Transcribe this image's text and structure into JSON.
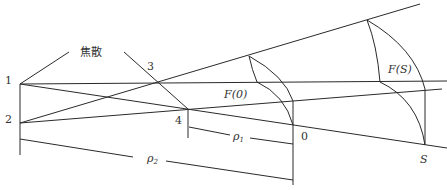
{
  "diagram": {
    "caustic_label": "焦散",
    "point_labels": {
      "p1": "1",
      "p2": "2",
      "p3": "3",
      "p4": "4",
      "p0": "0",
      "pS": "S"
    },
    "region_labels": {
      "F0": "F(0)",
      "FS": "F(S)"
    },
    "distance_labels": {
      "rho1": "ρ",
      "rho1_sub": "1",
      "rho2": "ρ",
      "rho2_sub": "2"
    }
  }
}
